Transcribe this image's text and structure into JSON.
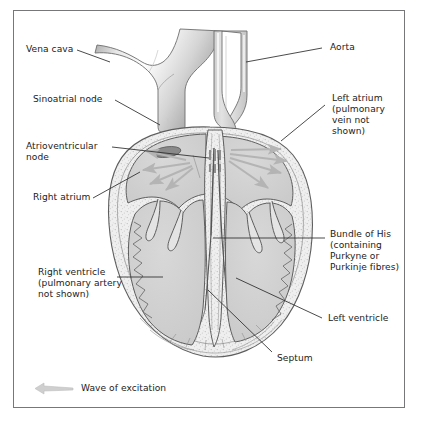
{
  "figure": {
    "type": "anatomical-diagram",
    "style": "greyscale line drawing, vertical section through the heart",
    "border_color": "#77777a",
    "background_color": "#ffffff",
    "text_color": "#1b1b1b",
    "leader_line_color": "#2a2a2a",
    "tissue_fill": "#d2d2d2",
    "muscle_wall_fill": "#efefef",
    "arrow_color": "#b4b4b4",
    "node_color": "#8a8a8a"
  },
  "labels": {
    "vena_cava": "Vena cava",
    "sinoatrial_node": "Sinoatrial node",
    "atrioventricular_node_l1": "Atrioventricular",
    "atrioventricular_node_l2": "node",
    "right_atrium": "Right atrium",
    "right_ventricle_l1": "Right ventricle",
    "right_ventricle_l2": "(pulmonary artery",
    "right_ventricle_l3": "not shown)",
    "aorta": "Aorta",
    "left_atrium_l1": "Left atrium",
    "left_atrium_l2": "(pulmonary",
    "left_atrium_l3": "vein not",
    "left_atrium_l4": "shown)",
    "bundle_of_his_l1": "Bundle of His",
    "bundle_of_his_l2": "(containing",
    "bundle_of_his_l3": "Purkyne or",
    "bundle_of_his_l4": "Purkinje fibres)",
    "left_ventricle": "Left ventricle",
    "septum": "Septum"
  },
  "legend": {
    "arrow_icon": "wave-of-excitation-arrow",
    "text": "Wave of excitation"
  },
  "structures": [
    {
      "name": "vena-cava",
      "side": "left",
      "note": "branching vessel entering right atrium from upper left"
    },
    {
      "name": "aorta",
      "side": "right",
      "note": "double-walled vessel curving up from left ventricle"
    },
    {
      "name": "right-atrium",
      "side": "left",
      "note": "upper left chamber containing sinoatrial node"
    },
    {
      "name": "left-atrium",
      "side": "right",
      "note": "upper right chamber, pulmonary vein not shown"
    },
    {
      "name": "right-ventricle",
      "side": "left",
      "note": "lower left chamber, pulmonary artery not shown"
    },
    {
      "name": "left-ventricle",
      "side": "right",
      "note": "lower right chamber with thick wall"
    },
    {
      "name": "septum",
      "side": "centre",
      "note": "stippled muscular wall dividing the ventricles"
    },
    {
      "name": "sinoatrial-node",
      "side": "left",
      "note": "dark oval pacemaker in right atrium wall"
    },
    {
      "name": "atrioventricular-node",
      "side": "centre",
      "note": "node at base of interatrial septum"
    },
    {
      "name": "bundle-of-his",
      "side": "centre",
      "note": "conducting fibres running down the septum"
    }
  ]
}
